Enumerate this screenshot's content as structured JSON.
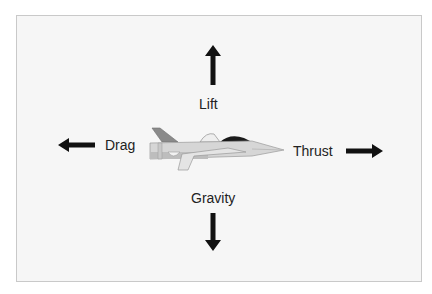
{
  "diagram": {
    "forces": {
      "lift": {
        "label": "Lift",
        "direction": "up"
      },
      "gravity": {
        "label": "Gravity",
        "direction": "down"
      },
      "drag": {
        "label": "Drag",
        "direction": "left"
      },
      "thrust": {
        "label": "Thrust",
        "direction": "right"
      }
    },
    "center_object": "fighter-jet",
    "colors": {
      "arrow": "#111111",
      "frame_bg": "#f6f6f6",
      "frame_border": "#c9c9c9",
      "jet_body": "#d9d9d9",
      "jet_tail": "#8a8a8a",
      "jet_canopy": "#1a1a1a"
    }
  }
}
